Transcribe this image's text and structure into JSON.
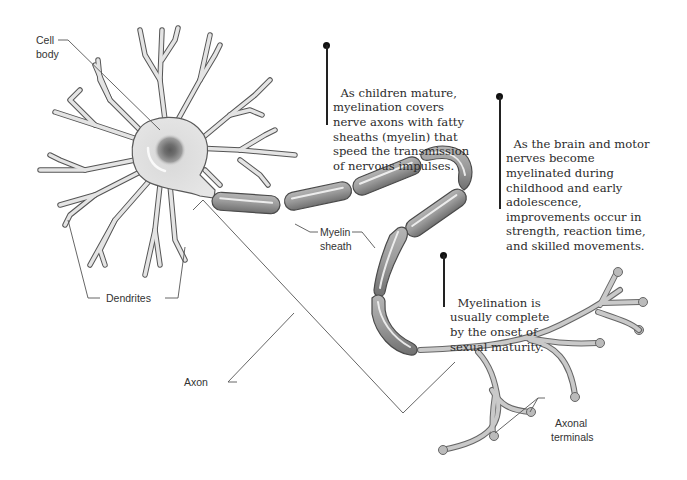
{
  "diagram": {
    "colors": {
      "background": "#ffffff",
      "cell_fill": "#e4e4e4",
      "cell_outline": "#555555",
      "nucleus": "#6e6e6e",
      "myelin_fill": "#9a9a9a",
      "text": "#2b2b2b"
    },
    "labels": {
      "cell_body": "Cell\nbody",
      "cell_body_line1": "Cell",
      "cell_body_line2": "body",
      "dendrites": "Dendrites",
      "myelin_line1": "Myelin",
      "myelin_line2": "sheath",
      "axon": "Axon",
      "axonal_line1": "Axonal",
      "axonal_line2": "terminals"
    },
    "notes": [
      {
        "id": "note-1",
        "text": "As children mature,\nmyelination covers\nnerve axons with fatty\nsheaths (myelin) that\nspeed the transmission\nof nervous impulses."
      },
      {
        "id": "note-2",
        "text": "As the brain and motor\nnerves become\nmyelinated during\nchildhood and early\nadolescence,\nimprovements occur in\nstrength, reaction time,\nand skilled movements."
      },
      {
        "id": "note-3",
        "text": "Myelination is\nusually complete\nby the onset of\nsexual maturity."
      }
    ]
  }
}
